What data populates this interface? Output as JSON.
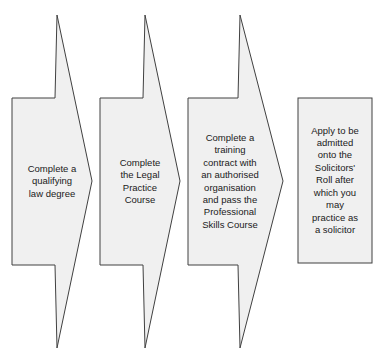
{
  "diagram": {
    "type": "flowchart",
    "orientation": "left-to-right",
    "canvas": {
      "width": 388,
      "height": 362,
      "background": "#ffffff"
    },
    "style": {
      "shape_fill": "#f0f0f0",
      "shape_stroke": "#404040",
      "stroke_width": 1,
      "text_color": "#1a1a1a",
      "font_size_px": 9.5
    },
    "nodes": [
      {
        "id": "node-1",
        "order": 1,
        "shape": "chevron-arrow",
        "label": "Complete a\nqualifying\nlaw degree",
        "lines": [
          "Complete a",
          "qualifying",
          "law degree"
        ]
      },
      {
        "id": "node-2",
        "order": 2,
        "shape": "chevron-arrow",
        "label": "Complete\nthe Legal\nPractice\nCourse",
        "lines": [
          "Complete",
          "the Legal",
          "Practice",
          "Course"
        ]
      },
      {
        "id": "node-3",
        "order": 3,
        "shape": "chevron-arrow",
        "label": "Complete a\ntraining\ncontract with\nan authorised\norganisation\nand pass the\nProfessional\nSkills Course",
        "lines": [
          "Complete a",
          "training",
          "contract with",
          "an authorised",
          "organisation",
          "and pass the",
          "Professional",
          "Skills Course"
        ]
      },
      {
        "id": "node-4",
        "order": 4,
        "shape": "rectangle",
        "label": "Apply to be\nadmitted\nonto the\nSolicitors'\nRoll after\nwhich you\nmay\npractice as\na solicitor",
        "lines": [
          "Apply to be",
          "admitted",
          "onto the",
          "Solicitors'",
          "Roll after",
          "which you",
          "may",
          "practice as",
          "a solicitor"
        ]
      }
    ]
  }
}
